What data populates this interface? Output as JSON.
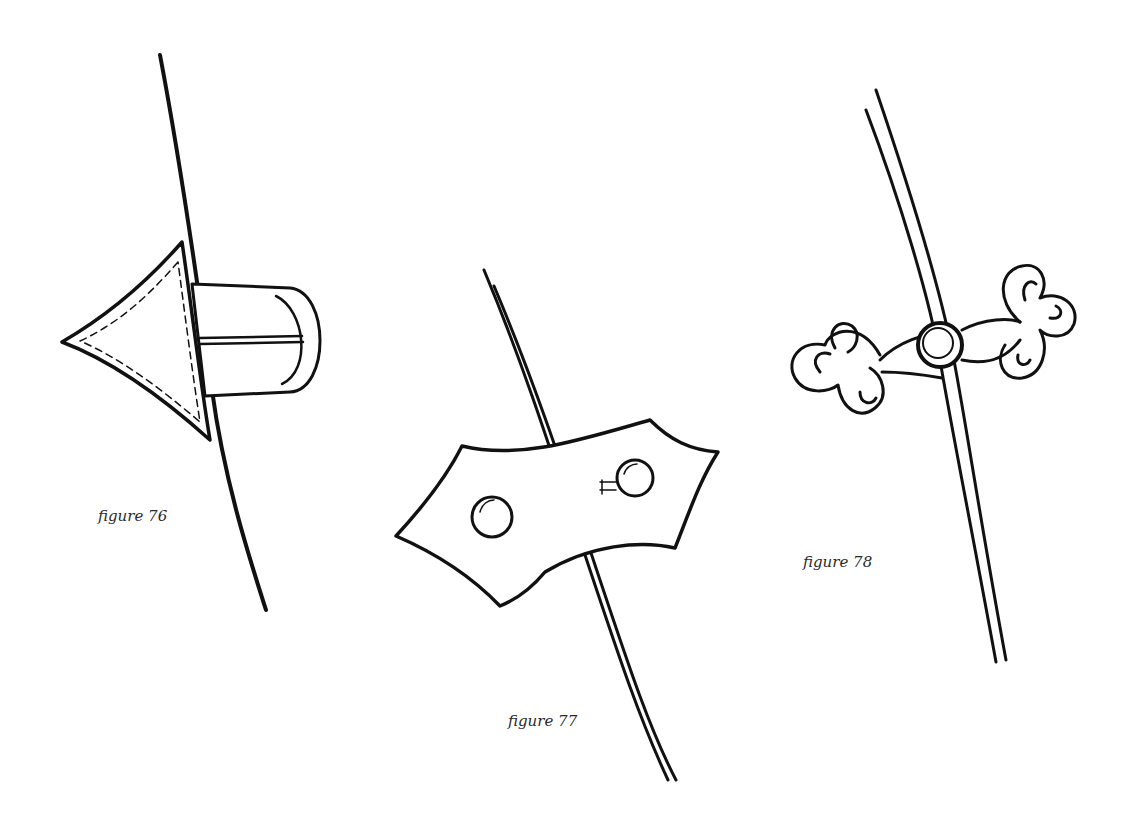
{
  "figures": [
    {
      "id": "76",
      "caption": "figure 76",
      "subject": "triangular leather toggle with loop on edge"
    },
    {
      "id": "77",
      "caption": "figure 77",
      "subject": "shaped tab fastener with two buttons across edge"
    },
    {
      "id": "78",
      "caption": "figure 78",
      "subject": "knotted cord frog fastening with center button"
    }
  ]
}
